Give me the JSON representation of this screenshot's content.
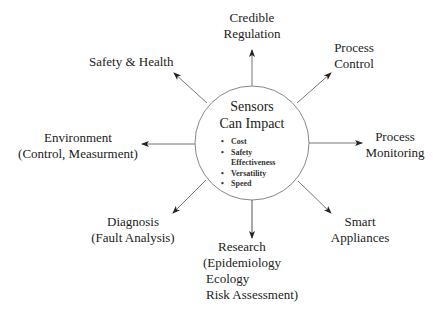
{
  "hub": {
    "title_line1": "Sensors",
    "title_line2": "Can Impact",
    "bullets": [
      {
        "bullet": "•",
        "text": "Cost"
      },
      {
        "bullet": "•",
        "text": "Safety"
      },
      {
        "bullet": "",
        "text": "Effectiveness"
      },
      {
        "bullet": "•",
        "text": "Versatility"
      },
      {
        "bullet": "•",
        "text": "Speed"
      }
    ]
  },
  "nodes": {
    "credible_regulation": {
      "lines": [
        "Credible",
        "Regulation"
      ]
    },
    "process_control": {
      "lines": [
        "Process",
        "Control"
      ]
    },
    "safety_health": {
      "lines": [
        "Safety & Health"
      ]
    },
    "process_monitoring": {
      "lines": [
        "Process",
        "Monitoring"
      ]
    },
    "environment": {
      "lines": [
        "Environment",
        "(Control, Measurment)"
      ]
    },
    "diagnosis": {
      "lines": [
        "Diagnosis",
        "(Fault Analysis)"
      ]
    },
    "smart_appliances": {
      "lines": [
        "Smart",
        "Appliances"
      ]
    },
    "research": {
      "lines": [
        "Research",
        "(Epidemiology",
        "Ecology",
        "Risk Assessment)"
      ]
    }
  },
  "colors": {
    "stroke": "#777777",
    "arrowhead": "#222222",
    "text": "#222222"
  }
}
